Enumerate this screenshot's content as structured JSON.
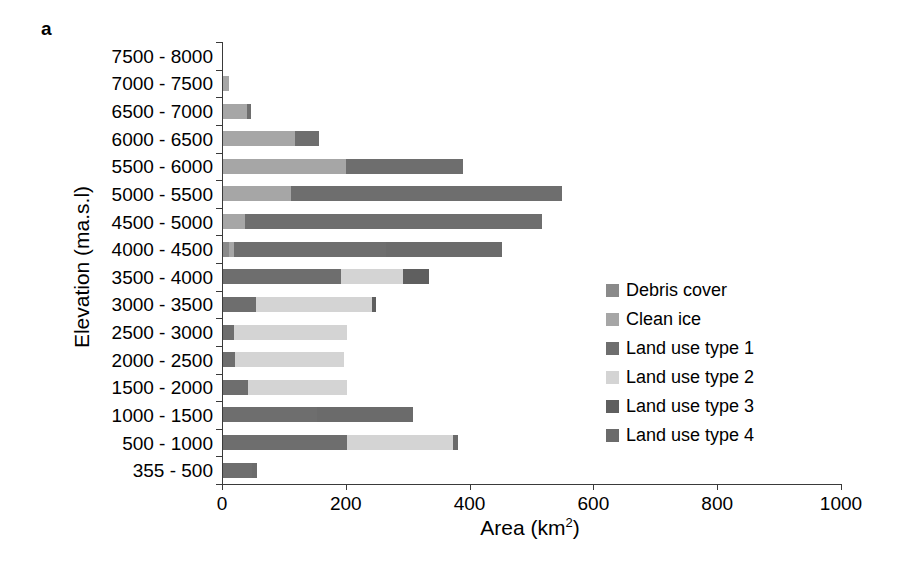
{
  "figure": {
    "panel_label": "a",
    "ylabel": "Elevation (ma.s.l)",
    "xlabel_main": "Area (km",
    "xlabel_sup": "2",
    "xlabel_tail": ")"
  },
  "chart_data": {
    "type": "bar",
    "orientation": "horizontal",
    "stacked": true,
    "title": "",
    "xlabel": "Area (km2)",
    "ylabel": "Elevation (ma.s.l)",
    "xlim": [
      0,
      1000
    ],
    "xticks": [
      0,
      200,
      400,
      600,
      800,
      1000
    ],
    "xticklabels": [
      "0",
      "200",
      "400",
      "600",
      "800",
      "1000"
    ],
    "grid": false,
    "legend_position": "center-right",
    "categories": [
      "7500 - 8000",
      "7000 - 7500",
      "6500 - 7000",
      "6000 - 6500",
      "5500 - 6000",
      "5000 - 5500",
      "4500 - 5000",
      "4000 - 4500",
      "3500 - 4000",
      "3000 - 3500",
      "2500 - 3000",
      "2000 - 2500",
      "1500 - 2000",
      "1000 - 1500",
      "500 - 1000",
      "355 - 500"
    ],
    "series": [
      {
        "name": "Debris cover",
        "color": "#8a8a8a",
        "values": [
          0,
          0,
          0,
          0,
          0,
          0,
          0,
          10,
          0,
          0,
          0,
          0,
          0,
          0,
          0,
          0
        ]
      },
      {
        "name": "Clean ice",
        "color": "#a6a6a6",
        "values": [
          0,
          9,
          38,
          117,
          198,
          110,
          35,
          8,
          0,
          0,
          0,
          0,
          0,
          0,
          0,
          0
        ]
      },
      {
        "name": "Land use type 1",
        "color": "#6e6e6e",
        "values": [
          0,
          0,
          8,
          38,
          190,
          437,
          481,
          245,
          190,
          53,
          18,
          20,
          40,
          152,
          200,
          47
        ]
      },
      {
        "name": "Land use type 2",
        "color": "#d4d4d4",
        "values": [
          0,
          0,
          0,
          0,
          0,
          0,
          0,
          0,
          100,
          187,
          182,
          175,
          160,
          0,
          172,
          0
        ]
      },
      {
        "name": "Land use type 3",
        "color": "#5f5f5f",
        "values": [
          0,
          0,
          0,
          0,
          0,
          0,
          0,
          0,
          43,
          8,
          0,
          0,
          0,
          0,
          0,
          0
        ]
      },
      {
        "name": "Land use type 4",
        "color": "#6b6b6b",
        "values": [
          0,
          0,
          0,
          0,
          0,
          0,
          0,
          188,
          0,
          0,
          0,
          0,
          0,
          155,
          8,
          8
        ]
      }
    ],
    "totals": [
      0,
      9,
      46,
      155,
      388,
      547,
      516,
      451,
      333,
      248,
      200,
      195,
      200,
      307,
      380,
      55
    ]
  },
  "legend": {
    "items": [
      {
        "label": "Debris cover",
        "color": "#8a8a8a"
      },
      {
        "label": "Clean ice",
        "color": "#a6a6a6"
      },
      {
        "label": "Land use type 1",
        "color": "#6e6e6e"
      },
      {
        "label": "Land use type 2",
        "color": "#d4d4d4"
      },
      {
        "label": "Land use type 3",
        "color": "#5f5f5f"
      },
      {
        "label": "Land use type 4",
        "color": "#6b6b6b"
      }
    ]
  }
}
